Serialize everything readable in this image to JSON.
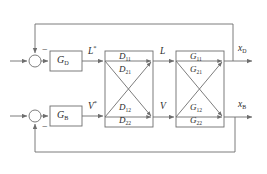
{
  "diagram": {
    "stroke_color": "#6e6e6e",
    "text_color": "#2b2b2b",
    "background": "#ffffff"
  },
  "controllers": [
    {
      "name": "controller-gd",
      "base": "G",
      "sub": "D",
      "x": 50,
      "y": 51,
      "w": 32,
      "h": 20
    },
    {
      "name": "controller-gb",
      "base": "G",
      "sub": "B",
      "x": 50,
      "y": 106,
      "w": 32,
      "h": 20
    }
  ],
  "summers": [
    {
      "name": "summing-junction-top",
      "cx": 35,
      "cy": 61,
      "r": 6,
      "sign": "−",
      "sign_x": 42,
      "sign_y": 45
    },
    {
      "name": "summing-junction-bottom",
      "cx": 35,
      "cy": 116,
      "r": 6,
      "sign": "−",
      "sign_x": 42,
      "sign_y": 124
    }
  ],
  "matrix_blocks": [
    {
      "name": "decoupler-block-d",
      "x": 105,
      "y": 51,
      "w": 48,
      "h": 76,
      "entries": [
        {
          "name": "entry-d11",
          "base": "D",
          "sub": "11",
          "x": 119,
          "y": 52
        },
        {
          "name": "entry-d21",
          "base": "D",
          "sub": "21",
          "x": 119,
          "y": 65
        },
        {
          "name": "entry-d12",
          "base": "D",
          "sub": "12",
          "x": 119,
          "y": 103
        },
        {
          "name": "entry-d22",
          "base": "D",
          "sub": "22",
          "x": 119,
          "y": 116
        }
      ]
    },
    {
      "name": "process-block-g",
      "x": 176,
      "y": 51,
      "w": 48,
      "h": 76,
      "entries": [
        {
          "name": "entry-g11",
          "base": "G",
          "sub": "11",
          "x": 190,
          "y": 52
        },
        {
          "name": "entry-g21",
          "base": "G",
          "sub": "21",
          "x": 190,
          "y": 65
        },
        {
          "name": "entry-g12",
          "base": "G",
          "sub": "12",
          "x": 190,
          "y": 103
        },
        {
          "name": "entry-g22",
          "base": "G",
          "sub": "22",
          "x": 190,
          "y": 116
        }
      ]
    }
  ],
  "signals": [
    {
      "name": "signal-l-star",
      "base": "L",
      "sup": "*",
      "x": 88,
      "y": 48
    },
    {
      "name": "signal-v-star",
      "base": "V",
      "sup": "*",
      "x": 88,
      "y": 103
    },
    {
      "name": "signal-l",
      "base": "L",
      "sup": "",
      "x": 160,
      "y": 48
    },
    {
      "name": "signal-v",
      "base": "V",
      "sup": "",
      "x": 160,
      "y": 103
    },
    {
      "name": "output-xd",
      "base": "x",
      "sub": "D",
      "x": 238,
      "y": 45
    },
    {
      "name": "output-xb",
      "base": "x",
      "sub": "B",
      "x": 238,
      "y": 101
    }
  ],
  "feedback": {
    "top_line_y": 24,
    "bottom_line_y": 152,
    "left_x": 35,
    "right_top_x": 233,
    "right_bottom_x": 235
  }
}
